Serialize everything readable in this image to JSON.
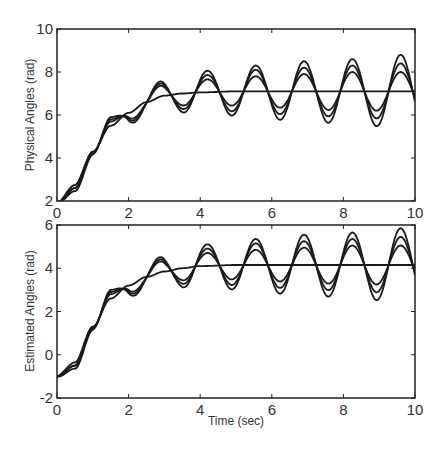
{
  "chart_data": [
    {
      "type": "line",
      "title": "",
      "xlabel": "",
      "ylabel": "Physical Angles (rad)",
      "xlim": [
        0,
        10
      ],
      "ylim": [
        2,
        10
      ],
      "xticks": [
        0,
        2,
        4,
        6,
        8,
        10
      ],
      "yticks": [
        2,
        4,
        6,
        8,
        10
      ],
      "grid": false,
      "legend": null,
      "start_value": 1.9,
      "final_value": 7.1,
      "series": [
        {
          "name": "reference",
          "x": [
            0,
            0.5,
            1,
            1.5,
            2,
            2.5,
            3,
            3.5,
            4,
            5,
            6,
            7,
            8,
            9,
            10
          ],
          "y": [
            1.9,
            2.6,
            4.3,
            5.5,
            6.1,
            6.6,
            6.9,
            7.0,
            7.05,
            7.1,
            7.1,
            7.1,
            7.1,
            7.1,
            7.1
          ]
        },
        {
          "name": "response-small",
          "osc_amplitude": [
            0.2,
            0.5,
            0.6,
            0.7,
            0.8,
            0.9,
            0.9
          ],
          "period": 1.35
        },
        {
          "name": "response-medium",
          "osc_amplitude": [
            0.3,
            0.6,
            0.8,
            1.0,
            1.1,
            1.2,
            1.3
          ],
          "period": 1.35
        },
        {
          "name": "response-large",
          "osc_amplitude": [
            0.4,
            0.7,
            1.0,
            1.2,
            1.4,
            1.5,
            1.7
          ],
          "period": 1.35
        }
      ],
      "peak_times": [
        1.5,
        2.75,
        4.1,
        5.45,
        6.8,
        8.15,
        9.5
      ],
      "largest_peaks": [
        6.05,
        7.6,
        8.05,
        8.3,
        8.5,
        8.6,
        8.8
      ]
    },
    {
      "type": "line",
      "title": "",
      "xlabel": "Time (sec)",
      "ylabel": "Estimated Angles (rad)",
      "xlim": [
        0,
        10
      ],
      "ylim": [
        -2,
        6
      ],
      "xticks": [
        0,
        2,
        4,
        6,
        8,
        10
      ],
      "yticks": [
        -2,
        0,
        2,
        4,
        6
      ],
      "grid": false,
      "legend": null,
      "start_value": -1.0,
      "final_value": 4.15,
      "series": [
        {
          "name": "reference",
          "x": [
            0,
            0.5,
            1,
            1.5,
            2,
            2.5,
            3,
            3.5,
            4,
            5,
            6,
            7,
            8,
            9,
            10
          ],
          "y": [
            -1.0,
            -0.5,
            1.3,
            2.6,
            3.2,
            3.6,
            3.85,
            4.0,
            4.1,
            4.15,
            4.15,
            4.15,
            4.15,
            4.15,
            4.15
          ]
        },
        {
          "name": "response-small",
          "osc_amplitude": [
            0.2,
            0.5,
            0.6,
            0.7,
            0.8,
            0.9,
            0.9
          ],
          "period": 1.35
        },
        {
          "name": "response-medium",
          "osc_amplitude": [
            0.3,
            0.6,
            0.8,
            1.0,
            1.1,
            1.2,
            1.3
          ],
          "period": 1.35
        },
        {
          "name": "response-large",
          "osc_amplitude": [
            0.4,
            0.7,
            1.0,
            1.2,
            1.4,
            1.5,
            1.7
          ],
          "period": 1.35
        }
      ],
      "peak_times": [
        1.5,
        2.75,
        4.1,
        5.45,
        6.8,
        8.15,
        9.5
      ],
      "largest_peaks": [
        3.0,
        4.55,
        5.0,
        5.3,
        5.5,
        5.6,
        5.8
      ]
    }
  ],
  "labels": {
    "top_ylabel": "Physical Angles (rad)",
    "bottom_ylabel": "Estimated Angles (rad)",
    "xlabel": "Time (sec)"
  },
  "colors": {
    "line": "#1a1a1a",
    "axis": "#222222",
    "background": "#ffffff"
  }
}
